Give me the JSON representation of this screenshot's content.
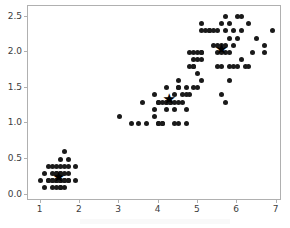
{
  "figure": {
    "background_color": "#ffffff",
    "marker_color": "#1a1a1a",
    "spine_color": "#b0b0b0",
    "tick_label_color": "#3c3c3c",
    "centroid_glyph": "★"
  },
  "axes": {
    "x_ticks": [
      "1",
      "2",
      "3",
      "4",
      "5",
      "6",
      "7"
    ],
    "x_tick_values": [
      1,
      2,
      3,
      4,
      5,
      6,
      7
    ],
    "y_ticks": [
      "0.0",
      "0.5",
      "1.0",
      "1.5",
      "2.0",
      "2.5"
    ],
    "y_tick_values": [
      0.0,
      0.5,
      1.0,
      1.5,
      2.0,
      2.5
    ],
    "xlim": [
      0.68,
      7.14
    ],
    "ylim": [
      -0.09,
      2.65
    ],
    "grid": false,
    "title": "",
    "xlabel": "",
    "ylabel": "",
    "legend": null
  },
  "chart_data": {
    "type": "scatter",
    "title": "",
    "xlabel": "",
    "ylabel": "",
    "xlim": [
      0.68,
      7.14
    ],
    "ylim": [
      -0.09,
      2.65
    ],
    "grid": false,
    "legend_position": "none",
    "marker": "circle",
    "marker_color": "#1a1a1a",
    "series": [
      {
        "name": "cluster-1",
        "points": [
          [
            1.0,
            0.2
          ],
          [
            1.1,
            0.1
          ],
          [
            1.1,
            0.3
          ],
          [
            1.2,
            0.2
          ],
          [
            1.2,
            0.4
          ],
          [
            1.3,
            0.2
          ],
          [
            1.3,
            0.3
          ],
          [
            1.3,
            0.4
          ],
          [
            1.3,
            0.1
          ],
          [
            1.4,
            0.2
          ],
          [
            1.4,
            0.3
          ],
          [
            1.4,
            0.4
          ],
          [
            1.4,
            0.1
          ],
          [
            1.4,
            0.2
          ],
          [
            1.5,
            0.2
          ],
          [
            1.5,
            0.3
          ],
          [
            1.5,
            0.4
          ],
          [
            1.5,
            0.1
          ],
          [
            1.5,
            0.2
          ],
          [
            1.5,
            0.5
          ],
          [
            1.6,
            0.2
          ],
          [
            1.6,
            0.4
          ],
          [
            1.6,
            0.6
          ],
          [
            1.6,
            0.2
          ],
          [
            1.6,
            0.1
          ],
          [
            1.7,
            0.2
          ],
          [
            1.7,
            0.3
          ],
          [
            1.7,
            0.4
          ],
          [
            1.7,
            0.5
          ],
          [
            1.7,
            0.2
          ],
          [
            1.9,
            0.2
          ],
          [
            1.9,
            0.4
          ],
          [
            1.5,
            0.3
          ],
          [
            1.4,
            0.3
          ],
          [
            1.3,
            0.2
          ],
          [
            1.2,
            0.2
          ],
          [
            1.6,
            0.3
          ],
          [
            1.5,
            0.2
          ],
          [
            1.4,
            0.2
          ],
          [
            1.5,
            0.1
          ]
        ]
      },
      {
        "name": "cluster-2",
        "points": [
          [
            3.0,
            1.1
          ],
          [
            3.3,
            1.0
          ],
          [
            3.5,
            1.0
          ],
          [
            3.6,
            1.3
          ],
          [
            3.7,
            1.0
          ],
          [
            3.9,
            1.1
          ],
          [
            3.9,
            1.2
          ],
          [
            3.9,
            1.4
          ],
          [
            4.0,
            1.0
          ],
          [
            4.0,
            1.3
          ],
          [
            4.0,
            1.3
          ],
          [
            4.1,
            1.0
          ],
          [
            4.1,
            1.3
          ],
          [
            4.2,
            1.2
          ],
          [
            4.2,
            1.3
          ],
          [
            4.2,
            1.5
          ],
          [
            4.2,
            1.3
          ],
          [
            4.3,
            1.3
          ],
          [
            4.3,
            1.3
          ],
          [
            4.4,
            1.2
          ],
          [
            4.4,
            1.3
          ],
          [
            4.4,
            1.4
          ],
          [
            4.5,
            1.3
          ],
          [
            4.5,
            1.5
          ],
          [
            4.5,
            1.6
          ],
          [
            4.5,
            1.5
          ],
          [
            4.6,
            1.3
          ],
          [
            4.6,
            1.4
          ],
          [
            4.7,
            1.2
          ],
          [
            4.7,
            1.4
          ],
          [
            4.7,
            1.5
          ],
          [
            4.8,
            1.4
          ],
          [
            4.8,
            1.8
          ],
          [
            4.9,
            1.5
          ],
          [
            4.9,
            1.8
          ],
          [
            5.0,
            1.7
          ],
          [
            5.0,
            1.5
          ],
          [
            5.1,
            1.6
          ],
          [
            4.0,
            1.0
          ],
          [
            4.1,
            1.0
          ],
          [
            4.5,
            1.0
          ],
          [
            4.7,
            1.0
          ],
          [
            4.4,
            1.0
          ],
          [
            4.8,
            2.0
          ],
          [
            4.9,
            2.0
          ],
          [
            5.0,
            2.0
          ],
          [
            5.1,
            2.0
          ],
          [
            4.9,
            1.8
          ],
          [
            5.0,
            1.9
          ],
          [
            4.9,
            1.9
          ]
        ]
      },
      {
        "name": "cluster-3",
        "points": [
          [
            5.1,
            1.9
          ],
          [
            5.1,
            2.0
          ],
          [
            5.1,
            2.3
          ],
          [
            5.1,
            2.4
          ],
          [
            5.2,
            2.3
          ],
          [
            5.3,
            2.3
          ],
          [
            5.3,
            2.3
          ],
          [
            5.4,
            2.3
          ],
          [
            5.4,
            2.1
          ],
          [
            5.5,
            1.8
          ],
          [
            5.5,
            2.1
          ],
          [
            5.5,
            2.3
          ],
          [
            5.6,
            1.8
          ],
          [
            5.6,
            2.1
          ],
          [
            5.6,
            2.4
          ],
          [
            5.7,
            2.1
          ],
          [
            5.7,
            2.3
          ],
          [
            5.7,
            2.5
          ],
          [
            5.8,
            1.6
          ],
          [
            5.8,
            1.8
          ],
          [
            5.8,
            2.2
          ],
          [
            5.8,
            2.4
          ],
          [
            5.9,
            1.8
          ],
          [
            5.9,
            2.1
          ],
          [
            5.9,
            2.3
          ],
          [
            6.0,
            1.8
          ],
          [
            6.0,
            2.5
          ],
          [
            6.1,
            1.9
          ],
          [
            6.1,
            2.5
          ],
          [
            6.1,
            2.3
          ],
          [
            6.2,
            1.8
          ],
          [
            6.3,
            1.8
          ],
          [
            6.3,
            2.4
          ],
          [
            6.4,
            2.0
          ],
          [
            6.5,
            2.2
          ],
          [
            6.7,
            2.0
          ],
          [
            6.7,
            2.1
          ],
          [
            6.9,
            2.3
          ],
          [
            5.6,
            1.4
          ],
          [
            5.7,
            1.3
          ],
          [
            5.8,
            2.0
          ],
          [
            6.0,
            2.2
          ],
          [
            5.5,
            2.0
          ],
          [
            5.6,
            2.0
          ],
          [
            5.7,
            2.0
          ]
        ]
      }
    ],
    "centroids": {
      "name": "cluster-centers",
      "marker": "star",
      "color": "#000000",
      "points": [
        [
          1.46,
          0.25
        ],
        [
          4.27,
          1.34
        ],
        [
          5.6,
          2.05
        ]
      ]
    }
  }
}
